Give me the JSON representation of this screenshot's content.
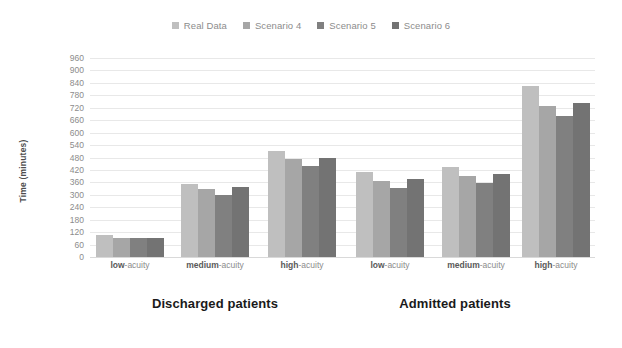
{
  "chart_data": {
    "type": "bar",
    "title": "",
    "xlabel": "",
    "ylabel": "Time (minutes)",
    "ylim": [
      0,
      960
    ],
    "ytick_step": 60,
    "yticks": [
      960,
      900,
      840,
      780,
      720,
      660,
      600,
      540,
      480,
      420,
      360,
      300,
      240,
      180,
      120,
      60,
      0
    ],
    "grid": true,
    "legend_position": "top-center",
    "groups": [
      "Discharged patients",
      "Admitted patients"
    ],
    "categories": [
      "low-acuity",
      "medium-acuity",
      "high-acuity",
      "low-acuity",
      "medium-acuity",
      "high-acuity"
    ],
    "category_group": [
      "Discharged patients",
      "Discharged patients",
      "Discharged patients",
      "Admitted patients",
      "Admitted patients",
      "Admitted patients"
    ],
    "series": [
      {
        "name": "Real Data",
        "color": "#bfbfbf",
        "values": [
          105,
          352,
          510,
          408,
          432,
          825
        ]
      },
      {
        "name": "Scenario 4",
        "color": "#a6a6a6",
        "values": [
          92,
          330,
          472,
          368,
          392,
          730
        ]
      },
      {
        "name": "Scenario 5",
        "color": "#808080",
        "values": [
          90,
          300,
          440,
          335,
          358,
          680
        ]
      },
      {
        "name": "Scenario 6",
        "color": "#737373",
        "values": [
          92,
          340,
          480,
          375,
          400,
          745
        ]
      }
    ]
  },
  "legend": {
    "items": [
      {
        "label": "Real Data",
        "color": "#bfbfbf"
      },
      {
        "label": "Scenario 4",
        "color": "#a6a6a6"
      },
      {
        "label": "Scenario 5",
        "color": "#808080"
      },
      {
        "label": "Scenario 6",
        "color": "#737373"
      }
    ]
  },
  "axes": {
    "y_title": "Time (minutes)"
  },
  "category_labels": [
    {
      "emph": "low",
      "rest": "-acuity"
    },
    {
      "emph": "medium",
      "rest": "-acuity"
    },
    {
      "emph": "high",
      "rest": "-acuity"
    },
    {
      "emph": "low",
      "rest": "-acuity"
    },
    {
      "emph": "medium",
      "rest": "-acuity"
    },
    {
      "emph": "high",
      "rest": "-acuity"
    }
  ],
  "section_titles": [
    "Discharged patients",
    "Admitted patients"
  ]
}
